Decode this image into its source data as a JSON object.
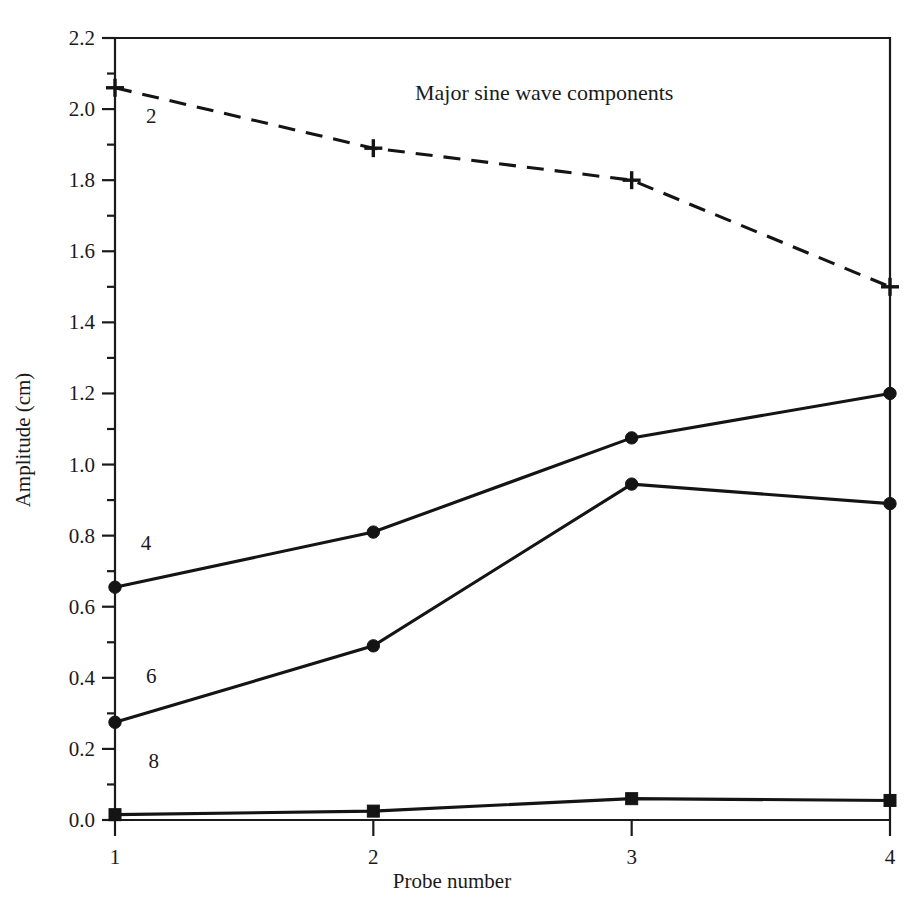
{
  "chart_data": {
    "type": "line",
    "title": "Major sine wave components",
    "xlabel": "Probe number",
    "ylabel": "Amplitude (cm)",
    "x": [
      1,
      2,
      3,
      4
    ],
    "xtick_labels": [
      "1",
      "2",
      "3",
      "4"
    ],
    "xlim": [
      1,
      4
    ],
    "ylim": [
      0.0,
      2.2
    ],
    "ytick_labels": [
      "0.0",
      "0.2",
      "0.4",
      "0.6",
      "0.8",
      "1.0",
      "1.2",
      "1.4",
      "1.6",
      "1.8",
      "2.0",
      "2.2"
    ],
    "ytick_values": [
      0.0,
      0.2,
      0.4,
      0.6,
      0.8,
      1.0,
      1.2,
      1.4,
      1.6,
      1.8,
      2.0,
      2.2
    ],
    "yminor_step": 0.1,
    "grid": false,
    "legend": "inline-series-labels",
    "series": [
      {
        "name": "2",
        "label": "2",
        "style": "dashed",
        "marker": "plus",
        "color": "#141414",
        "values": [
          2.06,
          1.89,
          1.8,
          1.5
        ],
        "label_x": 1.12,
        "label_y": 1.96
      },
      {
        "name": "4",
        "label": "4",
        "style": "solid",
        "marker": "circle",
        "color": "#141414",
        "values": [
          0.655,
          0.81,
          1.075,
          1.2
        ],
        "label_x": 1.1,
        "label_y": 0.76
      },
      {
        "name": "6",
        "label": "6",
        "style": "solid",
        "marker": "circle",
        "color": "#141414",
        "values": [
          0.275,
          0.49,
          0.945,
          0.89
        ],
        "label_x": 1.12,
        "label_y": 0.385
      },
      {
        "name": "8",
        "label": "8",
        "style": "solid",
        "marker": "square",
        "color": "#141414",
        "values": [
          0.015,
          0.025,
          0.06,
          0.055
        ],
        "label_x": 1.13,
        "label_y": 0.145
      }
    ]
  },
  "figure": {
    "background": "#ffffff",
    "ink": "#141414"
  }
}
